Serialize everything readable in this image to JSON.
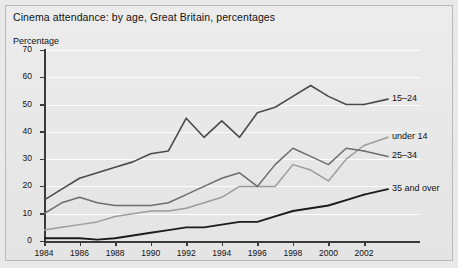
{
  "figure": {
    "title": "Cinema attendance: by age, Great Britain, percentages",
    "y_axis_title": "Percentage",
    "background_color": "#e9e9e9",
    "frame_color": "#b9b9b9"
  },
  "chart_data": {
    "type": "line",
    "title": "Cinema attendance: by age, Great Britain, percentages",
    "xlabel": "",
    "ylabel": "Percentage",
    "ylim": [
      0,
      70
    ],
    "ytick_labels": [
      "0",
      "10",
      "20",
      "30",
      "40",
      "50",
      "60",
      "70"
    ],
    "yticks": [
      0,
      10,
      20,
      30,
      40,
      50,
      60,
      70
    ],
    "xlim": [
      1984,
      2002
    ],
    "xtick_labels": [
      "1984",
      "1986",
      "1988",
      "1990",
      "1992",
      "1994",
      "1996",
      "1998",
      "2000",
      "2002"
    ],
    "xticks": [
      1984,
      1986,
      1988,
      1990,
      1992,
      1994,
      1996,
      1998,
      2000,
      2002
    ],
    "grid": true,
    "grid_color": "#fdfdfd",
    "legend_position": "right-inline",
    "x": [
      1984,
      1985,
      1986,
      1987,
      1988,
      1989,
      1990,
      1991,
      1992,
      1993,
      1994,
      1995,
      1996,
      1997,
      1998,
      1999,
      2000,
      2001,
      2002
    ],
    "series": [
      {
        "name": "15-24",
        "label": "15–24",
        "color": "#4a4a4a",
        "width": 1.6,
        "label_y": 52,
        "values": [
          15,
          19,
          23,
          25,
          27,
          29,
          32,
          33,
          45,
          38,
          44,
          38,
          47,
          49,
          53,
          57,
          53,
          50,
          50
        ]
      },
      {
        "name": "under 14",
        "label": "under 14",
        "color": "#9c9c9c",
        "width": 1.5,
        "label_y": 38,
        "values": [
          4,
          5,
          6,
          7,
          9,
          10,
          11,
          11,
          12,
          14,
          16,
          20,
          20,
          20,
          28,
          26,
          22,
          30,
          35
        ]
      },
      {
        "name": "25-34",
        "label": "25–34",
        "color": "#6d6d6d",
        "width": 1.5,
        "label_y": 31,
        "values": [
          10,
          14,
          16,
          14,
          13,
          13,
          13,
          14,
          17,
          20,
          23,
          25,
          20,
          28,
          34,
          31,
          28,
          34,
          33
        ]
      },
      {
        "name": "35 and over",
        "label": "35 and over",
        "color": "#1c1c1c",
        "width": 1.9,
        "label_y": 19,
        "values": [
          1,
          1,
          1,
          0.5,
          1,
          2,
          3,
          4,
          5,
          5,
          6,
          7,
          7,
          9,
          11,
          12,
          13,
          15,
          17
        ]
      }
    ]
  }
}
